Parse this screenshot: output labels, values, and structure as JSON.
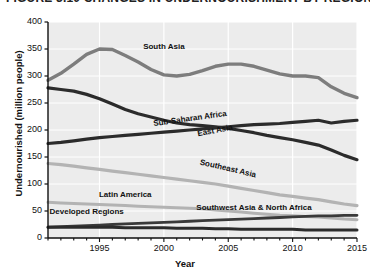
{
  "figure": {
    "title": "FIGURE 3.10  CHANGES IN UNDERNOURISHMENT BY REGION",
    "background": "#ffffff",
    "plot_background": "#ececec",
    "gridline_color": "#ffffff"
  },
  "chart_data": {
    "type": "line",
    "title": "FIGURE 3.10  CHANGES IN UNDERNOURISHMENT BY REGION",
    "xlabel": "Year",
    "ylabel": "Undernourished (million people)",
    "xlim": [
      1991,
      2015
    ],
    "ylim": [
      0,
      400
    ],
    "yticks": [
      0,
      50,
      100,
      150,
      200,
      250,
      300,
      350,
      400
    ],
    "ytick_labels": [
      "0",
      "50",
      "100",
      "150",
      "200",
      "250",
      "300",
      "350",
      "400"
    ],
    "xticks": [
      1995,
      2000,
      2005,
      2010,
      2015
    ],
    "xtick_labels": [
      "1995",
      "2000",
      "2005",
      "2010",
      "2015"
    ],
    "grid": "vertical-and-horizontal-white",
    "legend": "inline-labels-on-curves",
    "x": [
      1991,
      1992,
      1993,
      1994,
      1995,
      1996,
      1997,
      1998,
      1999,
      2000,
      2001,
      2002,
      2003,
      2004,
      2005,
      2006,
      2007,
      2008,
      2009,
      2010,
      2011,
      2012,
      2013,
      2014,
      2015
    ],
    "series": [
      {
        "name": "South Asia",
        "color": "#7d7d7d",
        "width": 3.4,
        "label_x": 2000,
        "label_y": 352,
        "label_rotation": 0,
        "values": [
          292,
          305,
          322,
          340,
          350,
          349,
          338,
          326,
          312,
          302,
          300,
          303,
          310,
          318,
          322,
          322,
          318,
          311,
          304,
          300,
          300,
          297,
          280,
          268,
          260
        ]
      },
      {
        "name": "East Asia",
        "color": "#2b2b2b",
        "width": 3.2,
        "label_x": 2004,
        "label_y": 196,
        "label_rotation": -11,
        "values": [
          278,
          275,
          272,
          266,
          258,
          248,
          238,
          230,
          224,
          218,
          213,
          210,
          208,
          206,
          203,
          199,
          195,
          190,
          186,
          182,
          177,
          172,
          163,
          153,
          145
        ]
      },
      {
        "name": "Sub-Saharan Africa",
        "color": "#2b2b2b",
        "width": 3.2,
        "label_x": 2002,
        "label_y": 218,
        "label_rotation": -8,
        "values": [
          175,
          177,
          180,
          183,
          186,
          188,
          190,
          192,
          194,
          196,
          198,
          200,
          202,
          204,
          206,
          208,
          210,
          211,
          212,
          214,
          216,
          218,
          213,
          216,
          218
        ]
      },
      {
        "name": "Southeast Asia",
        "color": "#b3b3b3",
        "width": 3.2,
        "label_x": 2005,
        "label_y": 126,
        "label_rotation": 13,
        "values": [
          138,
          136,
          133,
          130,
          127,
          124,
          121,
          118,
          115,
          112,
          109,
          106,
          103,
          100,
          96,
          92,
          88,
          84,
          80,
          77,
          74,
          71,
          67,
          63,
          60
        ]
      },
      {
        "name": "Latin America",
        "color": "#b3b3b3",
        "width": 3.0,
        "label_x": 1997,
        "label_y": 78,
        "label_rotation": 0,
        "values": [
          66,
          65,
          64,
          63,
          62,
          61,
          60,
          59,
          58,
          57,
          56,
          55,
          54,
          52,
          50,
          48,
          46,
          44,
          42,
          41,
          40,
          39,
          37,
          35,
          34
        ]
      },
      {
        "name": "Southwest Asia & North Africa",
        "color": "#3a3a3a",
        "width": 2.8,
        "label_x": 2007,
        "label_y": 54,
        "label_rotation": 0,
        "values": [
          20,
          21,
          22,
          23,
          24,
          25,
          26,
          27,
          28,
          29,
          30,
          31,
          32,
          33,
          34,
          35,
          36,
          37,
          38,
          39,
          40,
          41,
          41,
          42,
          42
        ]
      },
      {
        "name": "Developed Regions",
        "color": "#2b2b2b",
        "width": 3.0,
        "label_x": 1994,
        "label_y": 46,
        "label_rotation": 0,
        "values": [
          20,
          20,
          20,
          20,
          20,
          20,
          19,
          19,
          19,
          19,
          18,
          18,
          18,
          17,
          17,
          16,
          16,
          16,
          16,
          16,
          15,
          15,
          15,
          15,
          15
        ]
      }
    ]
  }
}
